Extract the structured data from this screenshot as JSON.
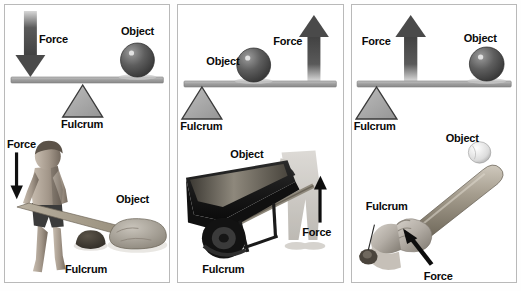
{
  "figure": {
    "panel_count": 3,
    "background": "#ffffff",
    "border_color": "#b9b9b9"
  },
  "labels": {
    "force": "Force",
    "object": "Object",
    "fulcrum": "Fulcrum"
  },
  "colors": {
    "bar": "#a9a9a9",
    "bar_outline": "#6e6e6e",
    "fulcrum_fill": "#a6a6a6",
    "fulcrum_outline": "#3a3a3a",
    "sphere_dark": "#3c3c3c",
    "sphere_light": "#8f8f8f",
    "arrow": "#4d4d4d",
    "text": "#0a0a0a"
  },
  "panels": [
    {
      "id": "panel-first-class-lever",
      "lever_class": "first-class",
      "diagram": {
        "force_direction": "down",
        "force_position": "left",
        "force_label": "Force",
        "object_position": "right",
        "object_label": "Object",
        "fulcrum_position": "center",
        "fulcrum_label": "Fulcrum"
      },
      "photo": {
        "scene": "boy prying a large rock with a plank over a small stone",
        "force_label": "Force",
        "force_direction": "down",
        "object_label": "Object",
        "fulcrum_label": "Fulcrum"
      }
    },
    {
      "id": "panel-second-class-lever",
      "lever_class": "second-class",
      "diagram": {
        "force_direction": "up",
        "force_position": "right",
        "force_label": "Force",
        "object_position": "center",
        "object_label": "Object",
        "fulcrum_position": "left",
        "fulcrum_label": "Fulcrum"
      },
      "photo": {
        "scene": "person lifting a loaded wheelbarrow by the handles",
        "force_label": "Force",
        "force_direction": "up",
        "object_label": "Object",
        "fulcrum_label": "Fulcrum"
      }
    },
    {
      "id": "panel-third-class-lever",
      "lever_class": "third-class",
      "diagram": {
        "force_direction": "up",
        "force_position": "center",
        "force_label": "Force",
        "object_position": "right",
        "object_label": "Object",
        "fulcrum_position": "left",
        "fulcrum_label": "Fulcrum"
      },
      "photo": {
        "scene": "hands gripping a baseball bat swinging at a ball",
        "force_label": "Force",
        "force_direction": "up-left",
        "object_label": "Object",
        "fulcrum_label": "Fulcrum"
      }
    }
  ]
}
